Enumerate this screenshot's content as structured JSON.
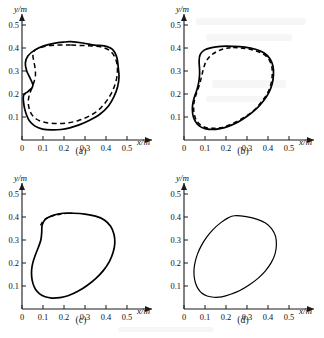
{
  "figure": {
    "title": "",
    "panels": [
      {
        "id": "a",
        "caption": "(a)"
      },
      {
        "id": "b",
        "caption": "(b)"
      },
      {
        "id": "c",
        "caption": "(c)"
      },
      {
        "id": "d",
        "caption": "(d)"
      }
    ],
    "axes": {
      "xlabel": "x/m",
      "ylabel": "y/m",
      "xticks": [
        "0",
        "0.1",
        "0.2",
        "0.3",
        "0.4",
        "0.5"
      ],
      "yticks": [
        "0.1",
        "0.2",
        "0.3",
        "0.4",
        "0.5"
      ],
      "xlim": [
        0,
        0.56
      ],
      "ylim": [
        0,
        0.56
      ],
      "grid": false
    },
    "colors": {
      "line": "#000000",
      "axis": "#1a1a1a",
      "background": "#ffffff"
    }
  },
  "chart_data": {
    "type": "line",
    "title": "",
    "xlabel": "x/m",
    "ylabel": "y/m",
    "xlim": [
      0,
      0.56
    ],
    "ylim": [
      0,
      0.56
    ],
    "grid": false,
    "legend_position": "none",
    "panels": [
      {
        "panel": "a",
        "caption": "(a)",
        "series": [
          {
            "name": "solid",
            "style": "solid",
            "closed": true,
            "x": [
              0.232,
              0.29,
              0.345,
              0.392,
              0.432,
              0.452,
              0.458,
              0.462,
              0.455,
              0.438,
              0.412,
              0.372,
              0.322,
              0.272,
              0.228,
              0.186,
              0.14,
              0.098,
              0.062,
              0.035,
              0.02,
              0.012,
              0.008,
              0.006,
              0.01,
              0.03,
              0.052,
              0.038,
              0.022,
              0.016,
              0.028,
              0.06,
              0.104,
              0.152,
              0.196
            ],
            "y": [
              0.468,
              0.462,
              0.452,
              0.448,
              0.43,
              0.392,
              0.348,
              0.3,
              0.252,
              0.206,
              0.162,
              0.124,
              0.094,
              0.072,
              0.058,
              0.05,
              0.048,
              0.052,
              0.066,
              0.092,
              0.124,
              0.152,
              0.176,
              0.198,
              0.218,
              0.232,
              0.258,
              0.296,
              0.33,
              0.368,
              0.4,
              0.428,
              0.448,
              0.46,
              0.466
            ]
          },
          {
            "name": "dashed",
            "style": "dashed",
            "closed": true,
            "x": [
              0.234,
              0.286,
              0.336,
              0.382,
              0.42,
              0.444,
              0.454,
              0.452,
              0.44,
              0.42,
              0.392,
              0.356,
              0.312,
              0.266,
              0.222,
              0.18,
              0.138,
              0.1,
              0.068,
              0.046,
              0.034,
              0.03,
              0.032,
              0.038,
              0.046,
              0.056,
              0.064,
              0.062,
              0.056,
              0.052,
              0.058,
              0.082,
              0.118,
              0.16,
              0.2
            ],
            "y": [
              0.452,
              0.45,
              0.448,
              0.442,
              0.424,
              0.39,
              0.348,
              0.302,
              0.256,
              0.212,
              0.172,
              0.136,
              0.11,
              0.092,
              0.082,
              0.078,
              0.08,
              0.086,
              0.1,
              0.122,
              0.15,
              0.178,
              0.202,
              0.224,
              0.244,
              0.272,
              0.308,
              0.344,
              0.376,
              0.404,
              0.424,
              0.438,
              0.448,
              0.452,
              0.452
            ]
          }
        ]
      },
      {
        "panel": "b",
        "caption": "(b)",
        "series": [
          {
            "name": "solid",
            "style": "solid",
            "closed": true,
            "x": [
              0.232,
              0.29,
              0.34,
              0.382,
              0.41,
              0.424,
              0.426,
              0.42,
              0.404,
              0.378,
              0.344,
              0.302,
              0.258,
              0.214,
              0.172,
              0.134,
              0.1,
              0.074,
              0.056,
              0.044,
              0.04,
              0.042,
              0.05,
              0.062,
              0.07,
              0.074,
              0.074,
              0.072,
              0.076,
              0.096,
              0.132,
              0.176
            ],
            "y": [
              0.446,
              0.442,
              0.432,
              0.414,
              0.386,
              0.35,
              0.31,
              0.268,
              0.226,
              0.186,
              0.148,
              0.114,
              0.086,
              0.066,
              0.054,
              0.05,
              0.054,
              0.066,
              0.086,
              0.112,
              0.142,
              0.174,
              0.206,
              0.24,
              0.274,
              0.308,
              0.34,
              0.372,
              0.404,
              0.428,
              0.44,
              0.446
            ]
          },
          {
            "name": "dashed",
            "style": "dashed",
            "closed": true,
            "x": [
              0.234,
              0.288,
              0.336,
              0.376,
              0.404,
              0.418,
              0.42,
              0.414,
              0.398,
              0.372,
              0.34,
              0.3,
              0.256,
              0.212,
              0.172,
              0.134,
              0.102,
              0.078,
              0.06,
              0.05,
              0.046,
              0.048,
              0.056,
              0.068,
              0.078,
              0.086,
              0.094,
              0.106,
              0.13,
              0.162,
              0.198
            ],
            "y": [
              0.44,
              0.436,
              0.426,
              0.41,
              0.384,
              0.348,
              0.308,
              0.266,
              0.224,
              0.186,
              0.148,
              0.116,
              0.09,
              0.07,
              0.058,
              0.056,
              0.06,
              0.072,
              0.092,
              0.118,
              0.148,
              0.18,
              0.212,
              0.246,
              0.28,
              0.312,
              0.344,
              0.376,
              0.404,
              0.424,
              0.436
            ]
          }
        ]
      },
      {
        "panel": "c",
        "caption": "(c)",
        "series": [
          {
            "name": "solid",
            "style": "solid",
            "closed": true,
            "x": [
              0.244,
              0.3,
              0.35,
              0.392,
              0.422,
              0.438,
              0.442,
              0.434,
              0.416,
              0.388,
              0.352,
              0.31,
              0.266,
              0.222,
              0.18,
              0.142,
              0.11,
              0.084,
              0.064,
              0.052,
              0.046,
              0.046,
              0.052,
              0.064,
              0.078,
              0.09,
              0.094,
              0.096,
              0.112,
              0.148,
              0.196
            ],
            "y": [
              0.456,
              0.452,
              0.442,
              0.424,
              0.394,
              0.356,
              0.314,
              0.27,
              0.226,
              0.184,
              0.146,
              0.112,
              0.084,
              0.064,
              0.054,
              0.052,
              0.058,
              0.072,
              0.094,
              0.122,
              0.154,
              0.188,
              0.222,
              0.258,
              0.294,
              0.33,
              0.366,
              0.4,
              0.428,
              0.446,
              0.456
            ]
          },
          {
            "name": "dashed",
            "style": "dashed",
            "closed": false,
            "x": [
              0.088,
              0.1,
              0.12,
              0.146,
              0.176,
              0.206
            ],
            "y": [
              0.398,
              0.418,
              0.434,
              0.444,
              0.45,
              0.454
            ]
          }
        ]
      },
      {
        "panel": "d",
        "caption": "(d)",
        "series": [
          {
            "name": "solid",
            "style": "solid",
            "closed": true,
            "x": [
              0.24,
              0.296,
              0.346,
              0.388,
              0.418,
              0.436,
              0.44,
              0.434,
              0.416,
              0.388,
              0.352,
              0.31,
              0.266,
              0.222,
              0.18,
              0.142,
              0.11,
              0.084,
              0.066,
              0.054,
              0.048,
              0.048,
              0.054,
              0.066,
              0.084,
              0.108,
              0.138,
              0.174,
              0.21
            ],
            "y": [
              0.444,
              0.44,
              0.428,
              0.41,
              0.382,
              0.346,
              0.306,
              0.264,
              0.222,
              0.182,
              0.146,
              0.114,
              0.088,
              0.07,
              0.058,
              0.056,
              0.062,
              0.076,
              0.098,
              0.126,
              0.158,
              0.192,
              0.228,
              0.266,
              0.304,
              0.342,
              0.378,
              0.41,
              0.434
            ]
          }
        ]
      }
    ]
  }
}
